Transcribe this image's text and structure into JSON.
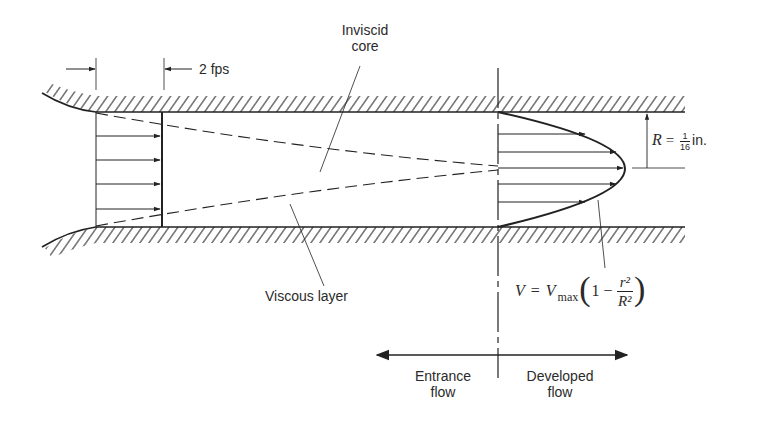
{
  "figure": {
    "type": "pipe-flow-entrance-region-diagram",
    "labels": {
      "inlet_velocity": "2 fps",
      "inviscid_core_line1": "Inviscid",
      "inviscid_core_line2": "core",
      "viscous_layer": "Viscous layer",
      "radius_symbol": "R",
      "radius_equals": "=",
      "radius_num": "1",
      "radius_den": "16",
      "radius_unit": "in.",
      "formula_lhs": "V",
      "formula_eq": "=",
      "formula_vmax": "V",
      "formula_sub": "max",
      "formula_one_minus": "1 −",
      "formula_num": "r²",
      "formula_den": "R²",
      "entrance_line1": "Entrance",
      "entrance_line2": "flow",
      "developed_line1": "Developed",
      "developed_line2": "flow"
    },
    "colors": {
      "ink": "#222222",
      "background": "#ffffff"
    }
  }
}
